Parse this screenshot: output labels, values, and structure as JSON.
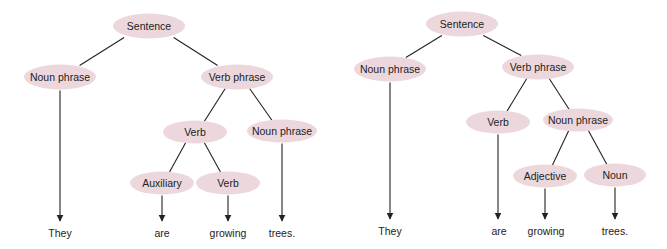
{
  "diagram": {
    "type": "parse-trees",
    "node_color": "#ecd8dc",
    "trees": [
      {
        "id": "tree-left",
        "nodes": [
          {
            "id": "S",
            "label": "Sentence",
            "x": 149,
            "y": 26,
            "w": 72,
            "h": 25
          },
          {
            "id": "NP1",
            "label": "Noun phrase",
            "x": 60,
            "y": 77,
            "w": 72,
            "h": 25
          },
          {
            "id": "VP",
            "label": "Verb phrase",
            "x": 237,
            "y": 77,
            "w": 72,
            "h": 25
          },
          {
            "id": "V",
            "label": "Verb",
            "x": 195,
            "y": 132,
            "w": 64,
            "h": 23
          },
          {
            "id": "NP2",
            "label": "Noun phrase",
            "x": 282,
            "y": 131,
            "w": 70,
            "h": 23
          },
          {
            "id": "AUX",
            "label": "Auxiliary",
            "x": 162,
            "y": 183,
            "w": 64,
            "h": 23
          },
          {
            "id": "V2",
            "label": "Verb",
            "x": 228,
            "y": 183,
            "w": 64,
            "h": 23
          }
        ],
        "edges": [
          {
            "from": "S",
            "to": "NP1"
          },
          {
            "from": "S",
            "to": "VP"
          },
          {
            "from": "VP",
            "to": "V"
          },
          {
            "from": "VP",
            "to": "NP2"
          },
          {
            "from": "V",
            "to": "AUX"
          },
          {
            "from": "V",
            "to": "V2"
          }
        ],
        "words": [
          {
            "text": "They",
            "x": 60,
            "y": 233,
            "from": "NP1"
          },
          {
            "text": "are",
            "x": 162,
            "y": 233,
            "from": "AUX"
          },
          {
            "text": "growing",
            "x": 228,
            "y": 233,
            "from": "V2"
          },
          {
            "text": "trees.",
            "x": 282,
            "y": 233,
            "from": "NP2"
          }
        ]
      },
      {
        "id": "tree-right",
        "nodes": [
          {
            "id": "S",
            "label": "Sentence",
            "x": 462,
            "y": 24,
            "w": 72,
            "h": 25
          },
          {
            "id": "NP1",
            "label": "Noun phrase",
            "x": 390,
            "y": 69,
            "w": 72,
            "h": 25
          },
          {
            "id": "VP",
            "label": "Verb phrase",
            "x": 538,
            "y": 67,
            "w": 72,
            "h": 25
          },
          {
            "id": "V",
            "label": "Verb",
            "x": 498,
            "y": 122,
            "w": 64,
            "h": 23
          },
          {
            "id": "NP2",
            "label": "Noun phrase",
            "x": 578,
            "y": 120,
            "w": 70,
            "h": 23
          },
          {
            "id": "ADJ",
            "label": "Adjective",
            "x": 545,
            "y": 176,
            "w": 64,
            "h": 23
          },
          {
            "id": "N",
            "label": "Noun",
            "x": 615,
            "y": 175,
            "w": 62,
            "h": 23
          }
        ],
        "edges": [
          {
            "from": "S",
            "to": "NP1"
          },
          {
            "from": "S",
            "to": "VP"
          },
          {
            "from": "VP",
            "to": "V"
          },
          {
            "from": "VP",
            "to": "NP2"
          },
          {
            "from": "NP2",
            "to": "ADJ"
          },
          {
            "from": "NP2",
            "to": "N"
          }
        ],
        "words": [
          {
            "text": "They",
            "x": 390,
            "y": 231,
            "from": "NP1"
          },
          {
            "text": "are",
            "x": 499,
            "y": 231,
            "from": "V"
          },
          {
            "text": "growing",
            "x": 546,
            "y": 231,
            "from": "ADJ"
          },
          {
            "text": "trees.",
            "x": 615,
            "y": 231,
            "from": "N"
          }
        ]
      }
    ]
  }
}
